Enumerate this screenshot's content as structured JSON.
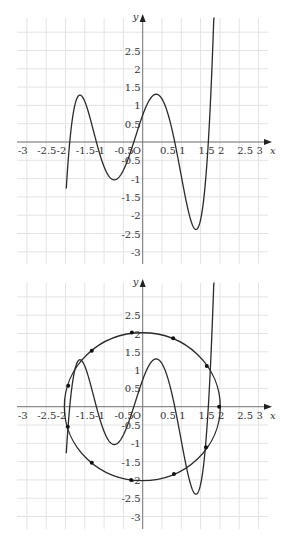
{
  "chart_data": [
    {
      "type": "line",
      "title": "",
      "xlabel": "x",
      "ylabel": "y",
      "origin_label": "O",
      "xlim": [
        -3.2,
        3.3
      ],
      "ylim": [
        -3.2,
        3.3
      ],
      "grid": true,
      "grid_step": 0.5,
      "x_ticks": [
        "-3",
        "-2.5",
        "-2",
        "-1.5",
        "-1",
        "-0.5",
        "0.5",
        "1",
        "1.5",
        "2",
        "2.5",
        "3"
      ],
      "x_tick_values": [
        -3,
        -2.5,
        -2,
        -1.5,
        -1,
        -0.5,
        0.5,
        1,
        1.5,
        2,
        2.5,
        3
      ],
      "y_ticks": [
        "2.5",
        "2",
        "1.5",
        "1",
        "0.5",
        "-0.5",
        "-1",
        "-1.5",
        "-2",
        "-2.5",
        "-3"
      ],
      "y_tick_values": [
        2.5,
        2,
        1.5,
        1,
        0.5,
        -0.5,
        -1,
        -1.5,
        -2,
        -2.5,
        -3
      ],
      "series": [
        {
          "name": "quintic curve",
          "kind": "polynomial_roots",
          "leading_coefficient": 1.0,
          "roots": [
            -1.89,
            -1.2,
            -0.23,
            0.83,
            1.7
          ],
          "x_range": [
            -1.98,
            1.86
          ],
          "key_points": [
            {
              "label": "local max",
              "x": -1.66,
              "y": 1.05
            },
            {
              "label": "local min",
              "x": -0.81,
              "y": -1.1
            },
            {
              "label": "local max",
              "x": 0.35,
              "y": 1.6
            },
            {
              "label": "local min",
              "x": 1.39,
              "y": -2.4
            }
          ]
        }
      ]
    },
    {
      "type": "line",
      "title": "",
      "xlabel": "x",
      "ylabel": "y",
      "origin_label": "O",
      "xlim": [
        -3.2,
        3.3
      ],
      "ylim": [
        -3.2,
        3.3
      ],
      "grid": true,
      "grid_step": 0.5,
      "x_ticks": [
        "-3",
        "-2.5",
        "-2",
        "-1.5",
        "-1",
        "-0.5",
        "0.5",
        "1",
        "1.5",
        "2",
        "2.5",
        "3"
      ],
      "x_tick_values": [
        -3,
        -2.5,
        -2,
        -1.5,
        -1,
        -0.5,
        0.5,
        1,
        1.5,
        2,
        2.5,
        3
      ],
      "y_ticks": [
        "2.5",
        "2",
        "1.5",
        "1",
        "0.5",
        "-0.5",
        "-1",
        "-1.5",
        "-2",
        "-2.5",
        "-3"
      ],
      "y_tick_values": [
        2.5,
        2,
        1.5,
        1,
        0.5,
        -0.5,
        -1,
        -1.5,
        -2,
        -2.5,
        -3
      ],
      "series": [
        {
          "name": "quintic curve",
          "kind": "polynomial_roots",
          "leading_coefficient": 1.0,
          "roots": [
            -1.89,
            -1.2,
            -0.23,
            0.83,
            1.7
          ],
          "x_range": [
            -1.98,
            1.86
          ]
        },
        {
          "name": "circle",
          "kind": "circle",
          "center": [
            -0.01,
            0
          ],
          "radius": 2.02
        },
        {
          "name": "points on circle",
          "kind": "scatter",
          "points": [
            {
              "x": -0.28,
              "y": 2.03
            },
            {
              "x": -1.32,
              "y": 1.53
            },
            {
              "x": -1.93,
              "y": 0.57
            },
            {
              "x": -1.94,
              "y": -0.55
            },
            {
              "x": -1.32,
              "y": -1.53
            },
            {
              "x": -0.3,
              "y": -2.0
            },
            {
              "x": 0.81,
              "y": -1.84
            },
            {
              "x": 1.64,
              "y": -1.11
            },
            {
              "x": 1.98,
              "y": 0.0
            },
            {
              "x": 1.66,
              "y": 1.11
            },
            {
              "x": 0.79,
              "y": 1.87
            }
          ]
        }
      ]
    }
  ],
  "layout": {
    "plots": [
      {
        "top": 0,
        "origin_px": [
          142.7,
          142.0
        ]
      },
      {
        "top": 265,
        "origin_px": [
          142.7,
          141.7
        ]
      }
    ],
    "unit_px_x": 38.6,
    "unit_px_y": 36.6,
    "grid_left_px": 17,
    "grid_right_px": 268,
    "grid_top_px": 18,
    "grid_bottom_px": 264,
    "colors": {
      "grid": "#e4e4e4",
      "axis": "#777777",
      "curve": "#2a2a2a",
      "label": "#333333"
    }
  }
}
